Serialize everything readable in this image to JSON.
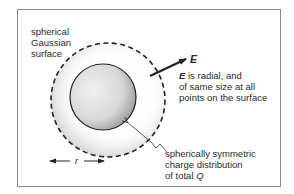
{
  "diagram": {
    "labels": {
      "gaussian_surface": [
        "spherical",
        "Gaussian",
        "surface"
      ],
      "field_symbol": "E",
      "field_desc_symbol": "E",
      "field_desc": [
        " is radial, and",
        "of same size at all",
        "points on the surface"
      ],
      "charge_dist": [
        "spherically symmetric",
        "charge distribution",
        "of total "
      ],
      "charge_symbol": "Q",
      "radius_symbol": "r"
    },
    "colors": {
      "line": "#222222",
      "frame": "#8a8a8a",
      "stipple": "#9a9a9a"
    },
    "shapes": {
      "outer_circle": {
        "cx": 108,
        "cy": 100,
        "r": 57,
        "style": "dashed"
      },
      "inner_circle": {
        "cx": 103,
        "cy": 97,
        "r": 33,
        "style": "solid"
      },
      "field_arrow": {
        "x1": 150,
        "y1": 76,
        "x2": 186,
        "y2": 59
      },
      "radius_arrow": {
        "x1": 50,
        "x2": 104,
        "y": 161
      }
    }
  }
}
